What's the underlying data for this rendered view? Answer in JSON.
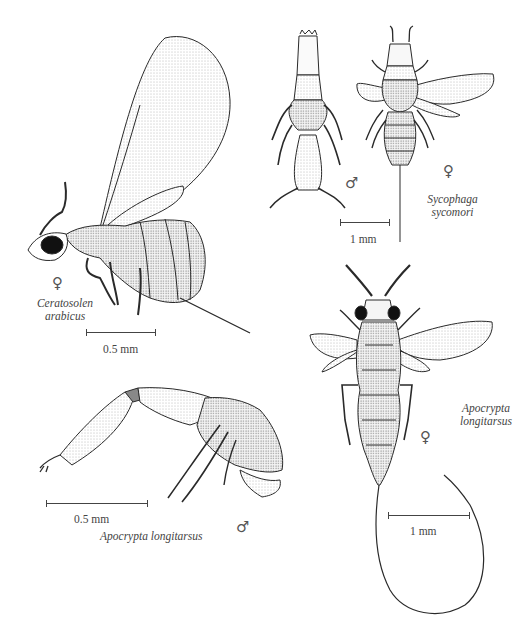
{
  "plate": {
    "figures": [
      {
        "id": "ceratosolen-arabicus",
        "species_line1": "Ceratosolen",
        "species_line2": "arabicus",
        "sex_symbol": "♀",
        "scale_label": "0.5 mm"
      },
      {
        "id": "sycophaga-sycomori-male",
        "sex_symbol": "♂"
      },
      {
        "id": "sycophaga-sycomori-female",
        "species_line1": "Sycophaga",
        "species_line2": "sycomori",
        "sex_symbol": "♀",
        "scale_label": "1 mm"
      },
      {
        "id": "apocrypta-longitarsus-male",
        "species": "Apocrypta longitarsus",
        "sex_symbol": "♂",
        "scale_label": "0.5 mm"
      },
      {
        "id": "apocrypta-longitarsus-female",
        "species_line1": "Apocrypta",
        "species_line2": "longitarsus",
        "sex_symbol": "♀",
        "scale_label": "1 mm"
      }
    ],
    "colors": {
      "background": "#ffffff",
      "ink": "#2a2a2a",
      "label": "#444444"
    }
  }
}
